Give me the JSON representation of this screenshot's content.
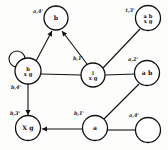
{
  "diagram": {
    "type": "node-link-graph",
    "background_color": "#fdfdfc",
    "stroke_color": "#111111",
    "node_fill": "#ffffff",
    "nodes": [
      {
        "id": "n_top",
        "name": "node-top",
        "cx": 56,
        "cy": 18,
        "r": 12,
        "label_lines": [
          "b"
        ],
        "corner_label": "a,4'",
        "corner_x": 38,
        "corner_y": 13
      },
      {
        "id": "n_topright",
        "name": "node-top-right",
        "cx": 148,
        "cy": 18,
        "r": 12.5,
        "label_lines": [
          "a b",
          "x g"
        ],
        "corner_label": "t,3'",
        "corner_x": 130,
        "corner_y": 12
      },
      {
        "id": "n_left",
        "name": "node-left",
        "cx": 28,
        "cy": 71,
        "r": 13,
        "label_lines": [
          "b",
          "x g"
        ],
        "corner_label": "b,4'",
        "corner_x": 16,
        "corner_y": 89
      },
      {
        "id": "n_center",
        "name": "node-center",
        "cx": 93,
        "cy": 75,
        "r": 12,
        "label_lines": [
          "i",
          "x g"
        ],
        "corner_label": "b,1'",
        "corner_x": 78,
        "corner_y": 60
      },
      {
        "id": "n_right",
        "name": "node-right",
        "cx": 147,
        "cy": 73,
        "r": 12.5,
        "label_lines": [
          "a b"
        ],
        "corner_label": "a,2'",
        "corner_x": 133,
        "corner_y": 61
      },
      {
        "id": "n_bottomleft",
        "name": "node-bottom-left",
        "cx": 28,
        "cy": 128,
        "r": 12.5,
        "label_lines": [
          "X g"
        ],
        "corner_label": "b,3'",
        "corner_x": 15,
        "corner_y": 115
      },
      {
        "id": "n_bottomcenter",
        "name": "node-bottom-center",
        "cx": 95,
        "cy": 128,
        "r": 12.5,
        "label_lines": [
          "a"
        ],
        "corner_label": "b,1'",
        "corner_x": 79,
        "corner_y": 115
      },
      {
        "id": "n_bottomright",
        "name": "node-bottom-right",
        "cx": 148,
        "cy": 130,
        "r": 12.5,
        "label_lines": [],
        "corner_label": "a,4'",
        "corner_x": 134,
        "corner_y": 117
      }
    ],
    "self_loop": {
      "name": "self-loop-left-node",
      "cx": 17,
      "cy": 59,
      "r": 8
    },
    "edges": [
      {
        "name": "edge-left-to-top",
        "x1": 36,
        "y1": 61,
        "x2": 52,
        "y2": 31,
        "arrow": true
      },
      {
        "name": "edge-center-to-top",
        "x1": 87,
        "y1": 64,
        "x2": 62,
        "y2": 31,
        "arrow": true
      },
      {
        "name": "edge-left-to-center",
        "x1": 41,
        "y1": 74,
        "x2": 81,
        "y2": 75,
        "arrow": false
      },
      {
        "name": "edge-center-to-topright",
        "x1": 103,
        "y1": 68,
        "x2": 140,
        "y2": 29,
        "arrow": false
      },
      {
        "name": "edge-center-to-right",
        "x1": 105,
        "y1": 75,
        "x2": 135,
        "y2": 74,
        "arrow": false
      },
      {
        "name": "edge-left-to-bottomleft",
        "x1": 28,
        "y1": 84,
        "x2": 28,
        "y2": 115,
        "arrow": true
      },
      {
        "name": "edge-bottomcenter-to-bottomleft",
        "x1": 82,
        "y1": 129,
        "x2": 42,
        "y2": 129,
        "arrow": true
      },
      {
        "name": "edge-bottomcenter-to-right",
        "x1": 104,
        "y1": 119,
        "x2": 139,
        "y2": 84,
        "arrow": false
      },
      {
        "name": "edge-bottomcenter-to-bottomright",
        "x1": 108,
        "y1": 130,
        "x2": 135,
        "y2": 130,
        "arrow": false
      }
    ]
  }
}
